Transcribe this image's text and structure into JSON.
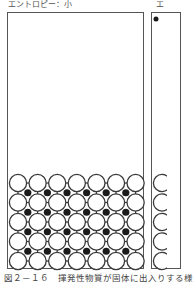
{
  "panels": [
    {
      "label": "エントロピー：小",
      "state": "ordered lattice at bottom"
    },
    {
      "label": "エ"
    }
  ],
  "caption": "図２－１６　揮発性物質が固体に出入りする様",
  "lattice": {
    "white_cols": 7,
    "white_rows": 5,
    "black_cols": 6,
    "black_rows": 4,
    "colors": {
      "line": "#3a3a3a",
      "fill_white": "#ffffff",
      "fill_black": "#1a1a1a"
    }
  }
}
